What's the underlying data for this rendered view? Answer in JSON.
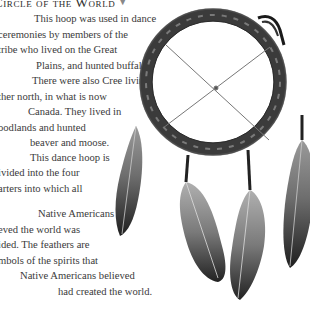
{
  "heading": {
    "title": "Circle of the World",
    "marker": "▼"
  },
  "paragraph": {
    "lines": [
      "This hoop was used in dance",
      "ceremonies by members of the",
      "tribe who lived on the Great",
      "Plains, and hunted buffalo.",
      "There were also Cree living",
      "ther north, in what is now",
      "Canada. They lived in",
      "oodlands and hunted",
      "beaver and moose.",
      "This dance hoop is",
      "ivided into the four",
      "arters into which all",
      "Native Americans",
      "eved the world was",
      "ided. The feathers are",
      "mbols of the spirits that",
      "Native Americans believed",
      "had created the world."
    ]
  },
  "image": {
    "subject": "dance-hoop-with-feathers",
    "description": "Wrapped hoop divided by crossed strings into four quarters, with four hanging feathers"
  }
}
